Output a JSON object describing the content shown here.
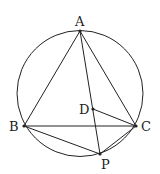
{
  "diagram": {
    "type": "geometry",
    "circle": {
      "cx": 80,
      "cy": 93.5,
      "r": 63
    },
    "points": {
      "A": {
        "label": "A",
        "x": 80,
        "y": 31
      },
      "B": {
        "label": "B",
        "x": 24,
        "y": 126
      },
      "C": {
        "label": "C",
        "x": 136,
        "y": 126
      },
      "D": {
        "label": "D",
        "x": 93,
        "y": 109
      },
      "P": {
        "label": "P",
        "x": 100,
        "y": 154
      }
    },
    "segments": [
      "AB",
      "AC",
      "BC",
      "AP",
      "BP",
      "CP",
      "DC"
    ],
    "stroke_color": "#222222"
  }
}
